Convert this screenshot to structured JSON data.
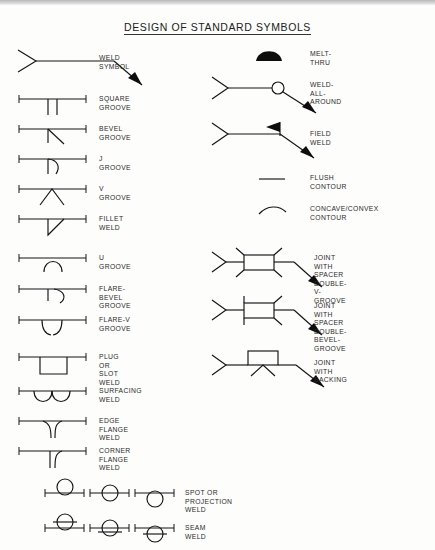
{
  "document": {
    "title": "DESIGN OF STANDARD SYMBOLS",
    "type": "welding-symbols-reference-chart"
  },
  "left_column": [
    {
      "label": "WELD SYMBOL",
      "symbol": "weld-symbol-leader-arrow"
    },
    {
      "label": "SQUARE GROOVE",
      "symbol": "square-groove"
    },
    {
      "label": "BEVEL GROOVE",
      "symbol": "bevel-groove"
    },
    {
      "label": "J GROOVE",
      "symbol": "j-groove"
    },
    {
      "label": "V GROOVE",
      "symbol": "v-groove"
    },
    {
      "label": "FILLET WELD",
      "symbol": "fillet-weld"
    },
    {
      "label": "U GROOVE",
      "symbol": "u-groove"
    },
    {
      "label": "FLARE-BEVEL GROOVE",
      "symbol": "flare-bevel-groove"
    },
    {
      "label": "FLARE-V GROOVE",
      "symbol": "flare-v-groove"
    },
    {
      "label": "PLUG OR SLOT WELD",
      "symbol": "plug-or-slot-weld"
    },
    {
      "label": "SURFACING WELD",
      "symbol": "surfacing-weld"
    },
    {
      "label": "EDGE FLANGE WELD",
      "symbol": "edge-flange-weld"
    },
    {
      "label": "CORNER FLANGE WELD",
      "symbol": "corner-flange-weld"
    }
  ],
  "bottom_rows": [
    {
      "label": "SPOT OR PROJECTION WELD",
      "symbol": "spot-or-projection-weld"
    },
    {
      "label": "SEAM WELD",
      "symbol": "seam-weld"
    }
  ],
  "right_column": [
    {
      "label": "MELT-THRU",
      "symbol": "melt-thru"
    },
    {
      "label": "WELD-ALL-AROUND",
      "symbol": "weld-all-around"
    },
    {
      "label": "FIELD WELD",
      "symbol": "field-weld"
    },
    {
      "label": "FLUSH CONTOUR",
      "symbol": "flush-contour"
    },
    {
      "label": "CONCAVE/CONVEX CONTOUR",
      "symbol": "concave-convex-contour"
    },
    {
      "label": "JOINT WITH SPACER\nDOUBLE-V-GROOVE",
      "symbol": "joint-with-spacer-double-v-groove"
    },
    {
      "label": "JOINT WITH SPACER\nDOUBLE-BEVEL-GROOVE",
      "symbol": "joint-with-spacer-double-bevel-groove"
    },
    {
      "label": "JOINT WITH BACKING",
      "symbol": "joint-with-backing"
    }
  ],
  "colors": {
    "ink": "#141414",
    "paper": "#fdfdfc",
    "text": "#2a2a2a"
  }
}
